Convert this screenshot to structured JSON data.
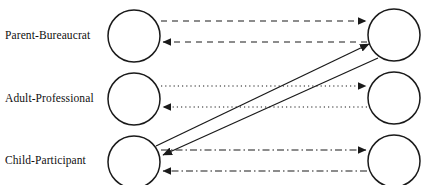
{
  "diagram": {
    "canvas": {
      "width": 422,
      "height": 185,
      "background": "#ffffff"
    },
    "stroke_color": "#1a1a1a",
    "rows": [
      {
        "id": "parent-bureaucrat",
        "label": "Parent-Bureaucrat",
        "label_y": 36,
        "line_style": "dashed",
        "left_node": {
          "cx": 134,
          "cy": 36,
          "r": 26
        },
        "right_node": {
          "cx": 394,
          "cy": 35,
          "r": 26
        },
        "connectors": [
          {
            "name": "rightward",
            "y": 21,
            "direction": "right",
            "style": "dashed"
          },
          {
            "name": "leftward",
            "y": 42,
            "direction": "left",
            "style": "dashed"
          }
        ]
      },
      {
        "id": "adult-professional",
        "label": "Adult-Professional",
        "label_y": 99,
        "line_style": "dotted",
        "left_node": {
          "cx": 134,
          "cy": 99,
          "r": 26
        },
        "right_node": {
          "cx": 394,
          "cy": 98,
          "r": 26
        },
        "connectors": [
          {
            "name": "rightward",
            "y": 86,
            "direction": "right",
            "style": "dotted"
          },
          {
            "name": "leftward",
            "y": 107,
            "direction": "left",
            "style": "dotted"
          }
        ]
      },
      {
        "id": "child-participant",
        "label": "Child-Participant",
        "label_y": 161,
        "line_style": "dash-dot",
        "left_node": {
          "cx": 134,
          "cy": 162,
          "r": 26
        },
        "right_node": {
          "cx": 394,
          "cy": 161,
          "r": 26
        },
        "connectors": [
          {
            "name": "rightward",
            "y": 150,
            "direction": "right",
            "style": "dash-dot"
          },
          {
            "name": "leftward",
            "y": 171,
            "direction": "left",
            "style": "dash-dot"
          }
        ]
      }
    ],
    "diagonals": [
      {
        "name": "child-left-to-parent-right",
        "style": "solid",
        "direction": "up-right",
        "from": {
          "x": 156,
          "y": 146
        },
        "to": {
          "x": 372,
          "y": 42
        }
      },
      {
        "name": "parent-right-to-child-left",
        "style": "solid",
        "direction": "down-left",
        "from": {
          "x": 376,
          "y": 57
        },
        "to": {
          "x": 160,
          "y": 155
        }
      }
    ]
  }
}
